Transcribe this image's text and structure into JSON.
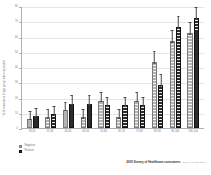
{
  "chart_data": {
    "type": "bar",
    "title": "",
    "subtitle": "",
    "xlabel": "",
    "ylabel": "% of consumers in age group who responded",
    "ylim": [
      0,
      80
    ],
    "yticks": [
      0,
      10,
      20,
      30,
      40,
      50,
      60,
      70,
      80
    ],
    "ytick_labels": [
      "0",
      "10",
      "20",
      "30",
      "40",
      "50",
      "60",
      "70",
      "80"
    ],
    "grid": true,
    "legend_position": "bottom-left",
    "categories": [
      "18-24",
      "25-34",
      "35-44",
      "45-54",
      "55-64",
      "65-74",
      "75-84",
      "85-94",
      "95-104",
      "105-114"
    ],
    "series": [
      {
        "name": "Negative",
        "color": "#b3b3b3",
        "values": [
          6,
          7,
          12,
          7,
          18,
          7,
          18,
          43,
          57,
          62
        ],
        "errors": [
          3,
          3,
          3,
          3,
          3,
          3,
          3,
          4,
          4,
          4
        ]
      },
      {
        "name": "Positive",
        "color": "#2b2b2b",
        "values": [
          8,
          9,
          16,
          16,
          15,
          15,
          15,
          28,
          66,
          72
        ],
        "errors": [
          3,
          3,
          3,
          3,
          3,
          3,
          3,
          4,
          4,
          4
        ]
      }
    ]
  },
  "footer": {
    "main": "2005 Survey of Healthcare consumers",
    "sub": "Source: deloitte 2013"
  }
}
